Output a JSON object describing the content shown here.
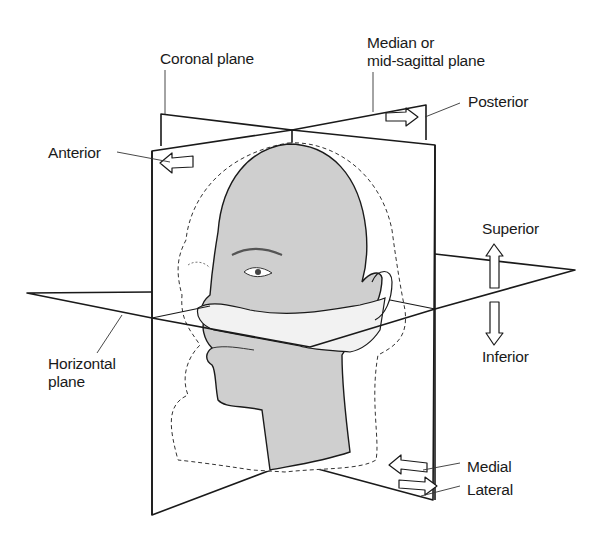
{
  "diagram": {
    "colors": {
      "line": "#1a1a1a",
      "head_fill": "#cfcfcf",
      "background": "#ffffff",
      "dashed_outline": "#333333"
    },
    "labels": {
      "coronal": "Coronal plane",
      "median_line1": "Median or",
      "median_line2": "mid-sagittal plane",
      "posterior": "Posterior",
      "anterior": "Anterior",
      "superior": "Superior",
      "inferior": "Inferior",
      "horizontal_line1": "Horizontal",
      "horizontal_line2": "plane",
      "medial": "Medial",
      "lateral": "Lateral"
    },
    "planes": [
      "coronal",
      "median",
      "horizontal"
    ],
    "arrows": [
      {
        "name": "anterior-arrow",
        "direction": "left"
      },
      {
        "name": "posterior-arrow",
        "direction": "right"
      },
      {
        "name": "superior-arrow",
        "direction": "up"
      },
      {
        "name": "inferior-arrow",
        "direction": "down"
      },
      {
        "name": "medial-arrow",
        "direction": "left"
      },
      {
        "name": "lateral-arrow",
        "direction": "right"
      }
    ]
  }
}
